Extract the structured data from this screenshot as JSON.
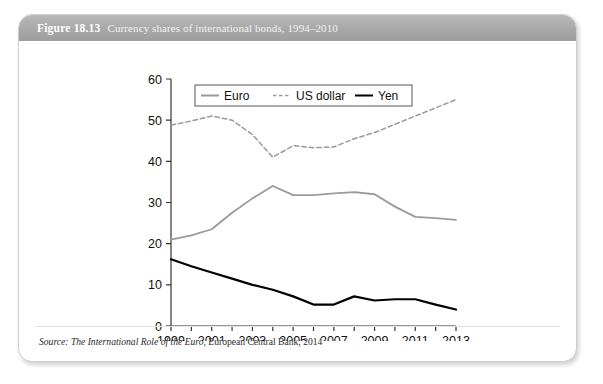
{
  "figure": {
    "number": "Figure 18.13",
    "caption": "Currency shares of international bonds, 1994–2010",
    "source_prefix": "Source:",
    "source_italic": "The International Role of the Euro",
    "source_rest": ", European Central Bank, 2014"
  },
  "colors": {
    "header_band": "#a8a8a8",
    "euro": "#9a9a9a",
    "us_dollar": "#9a9a9a",
    "yen": "#000000",
    "axis": "#333333",
    "card_border": "#cfcfcf"
  },
  "chart_data": {
    "type": "line",
    "title": "Currency shares of international bonds, 1994–2010",
    "xlabel": "",
    "ylabel": "",
    "xlim": [
      1999,
      2013
    ],
    "ylim": [
      0,
      60
    ],
    "yticks": [
      0,
      10,
      20,
      30,
      40,
      50,
      60
    ],
    "ytick_labels": [
      "0",
      "10",
      "20",
      "30",
      "40",
      "50",
      "60"
    ],
    "xticks": [
      1999,
      2000,
      2001,
      2002,
      2003,
      2004,
      2005,
      2006,
      2007,
      2008,
      2009,
      2010,
      2011,
      2012,
      2013
    ],
    "xtick_labels": [
      "1999",
      "",
      "2001",
      "",
      "2003",
      "",
      "2005",
      "",
      "2007",
      "",
      "2009",
      "",
      "2011",
      "",
      "2013"
    ],
    "grid": false,
    "legend_position": "top-left-inside",
    "x": [
      1999,
      2000,
      2001,
      2002,
      2003,
      2004,
      2005,
      2006,
      2007,
      2008,
      2009,
      2010,
      2011,
      2012,
      2013
    ],
    "series": [
      {
        "name": "Euro",
        "style": "solid",
        "color": "#9a9a9a",
        "width": 1.8,
        "values": [
          21.0,
          22.0,
          23.5,
          27.5,
          31.0,
          34.0,
          31.8,
          31.8,
          32.2,
          32.5,
          32.0,
          29.0,
          26.5,
          26.2,
          25.8
        ]
      },
      {
        "name": "US dollar",
        "style": "dashed",
        "color": "#9a9a9a",
        "width": 1.5,
        "values": [
          48.8,
          49.8,
          51.0,
          50.0,
          46.5,
          41.0,
          43.8,
          43.3,
          43.5,
          45.5,
          47.0,
          49.0,
          51.0,
          53.0,
          55.0
        ]
      },
      {
        "name": "Yen",
        "style": "solid",
        "color": "#000000",
        "width": 2.2,
        "values": [
          16.2,
          14.5,
          13.0,
          11.5,
          10.0,
          8.8,
          7.2,
          5.2,
          5.2,
          7.2,
          6.2,
          6.5,
          6.5,
          5.2,
          4.0
        ]
      }
    ],
    "legend": [
      {
        "label": "Euro",
        "style": "solid",
        "color": "#9a9a9a"
      },
      {
        "label": "US dollar",
        "style": "dashed",
        "color": "#9a9a9a"
      },
      {
        "label": "Yen",
        "style": "solid",
        "color": "#000000"
      }
    ]
  }
}
